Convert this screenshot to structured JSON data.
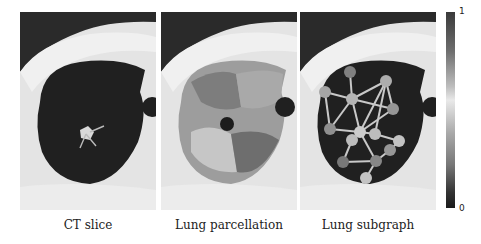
{
  "panels": [
    {
      "id": "ct-slice",
      "caption": "CT slice"
    },
    {
      "id": "lung-parcellation",
      "caption": "Lung parcellation"
    },
    {
      "id": "lung-subgraph",
      "caption": "Lung subgraph"
    }
  ],
  "colorbar": {
    "max_label": "1",
    "min_label": "0",
    "colormap": "grayscale-diverging"
  },
  "graph": {
    "nodes": [
      {
        "id": 0,
        "value": 0.45
      },
      {
        "id": 1,
        "value": 0.7
      },
      {
        "id": 2,
        "value": 0.8
      },
      {
        "id": 3,
        "value": 0.75
      },
      {
        "id": 4,
        "value": 0.6
      },
      {
        "id": 5,
        "value": 0.55
      },
      {
        "id": 6,
        "value": 0.95
      },
      {
        "id": 7,
        "value": 0.85
      },
      {
        "id": 8,
        "value": 0.9
      },
      {
        "id": 9,
        "value": 0.4
      },
      {
        "id": 10,
        "value": 0.5
      },
      {
        "id": 11,
        "value": 0.6
      },
      {
        "id": 12,
        "value": 0.9
      },
      {
        "id": 13,
        "value": 0.85
      }
    ]
  }
}
